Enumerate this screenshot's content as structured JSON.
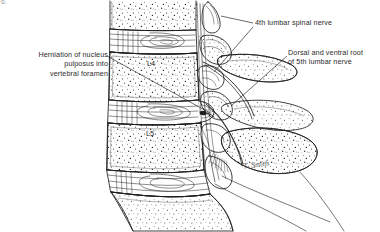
{
  "figure": {
    "marker": "6.",
    "background_color": "#ffffff",
    "ink_color": "#1d1d1d",
    "width": 380,
    "height": 232
  },
  "labels": {
    "herniation": "Herniation of nucleus\npulposus into\nvertebral foramen",
    "fourth_lumbar_spinal_nerve": "4th lumbar spinal nerve",
    "fifth_lumbar_root": "Dorsal and ventral root\nof 5th lumbar nerve"
  },
  "vertebrae": [
    {
      "id": "l4",
      "label": "L4"
    },
    {
      "id": "l5",
      "label": "L5"
    }
  ],
  "signature": "T. Smith",
  "anatomy_parts": [
    "L3 vertebral body (partial)",
    "L3-L4 intervertebral disc",
    "L4 vertebral body",
    "L4-L5 intervertebral disc with posterior herniation",
    "L5 vertebral body",
    "L5-S1 intervertebral disc",
    "sacrum",
    "spinous processes",
    "superior articular process",
    "inferior articular process",
    "transverse process of L4",
    "transverse process of L5",
    "4th lumbar spinal nerve",
    "dorsal and ventral root of 5th lumbar nerve",
    "ligamentum flavum",
    "anterior longitudinal ligament"
  ]
}
